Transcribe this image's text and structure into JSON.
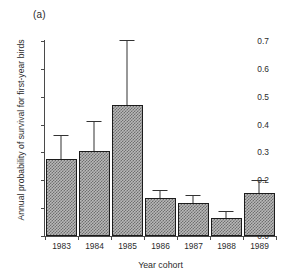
{
  "figure": {
    "panel_label": "(a)",
    "background": "#ffffff"
  },
  "chart_data": {
    "type": "bar",
    "title": "",
    "panel": "(a)",
    "categories": [
      "1983",
      "1984",
      "1985",
      "1986",
      "1987",
      "1988",
      "1989"
    ],
    "values": [
      0.278,
      0.305,
      0.472,
      0.138,
      0.12,
      0.063,
      0.153
    ],
    "error_upper": [
      0.358,
      0.41,
      0.7,
      0.162,
      0.143,
      0.085,
      0.199
    ],
    "error_type": "upper-only",
    "xlabel": "Year cohort",
    "ylabel": "Annual probability of survival for first-year birds",
    "ylim": [
      0.0,
      0.7
    ],
    "yticks": [
      "0.0",
      "0.1",
      "0.2",
      "0.3",
      "0.4",
      "0.5",
      "0.6",
      "0.7"
    ],
    "ytick_values": [
      0.0,
      0.1,
      0.2,
      0.3,
      0.4,
      0.5,
      0.6,
      0.7
    ],
    "grid": false,
    "legend": null,
    "bar_fill": "hatched-gray",
    "bar_edge_color": "#1c1c1c",
    "axis_color": "#4a4a4a"
  }
}
